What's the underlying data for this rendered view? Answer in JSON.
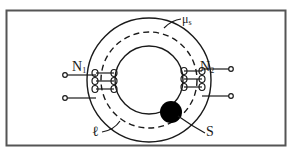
{
  "figure": {
    "colors": {
      "line": "#1a1a1a",
      "frame": "#555555",
      "background": "#ffffff",
      "defect": "#000000"
    }
  },
  "labels": {
    "winding_1": {
      "base": "N",
      "sub": "1"
    },
    "winding_2": {
      "base": "N",
      "sub": "2"
    },
    "permeability": {
      "base": "μ",
      "sub": "s"
    },
    "path_length": "ℓ",
    "defect": "S"
  }
}
